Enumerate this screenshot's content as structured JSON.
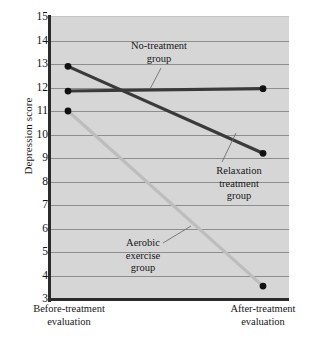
{
  "chart_data": {
    "type": "line",
    "title": "",
    "xlabel": "",
    "ylabel": "Depression score",
    "categories": [
      "Before-treatment evaluation",
      "After-treatment evaluation"
    ],
    "x": [
      0,
      1
    ],
    "ylim": [
      3,
      15
    ],
    "yticks": [
      15,
      14,
      13,
      12,
      11,
      10,
      9,
      8,
      7,
      6,
      5,
      4,
      3
    ],
    "grid": true,
    "legend_position": "inline-annotations",
    "series": [
      {
        "name": "No-treatment group",
        "values": [
          11.85,
          11.95
        ],
        "color": "#3a3a3a",
        "marker": "filled-circle"
      },
      {
        "name": "Relaxation treatment group",
        "values": [
          12.9,
          9.2
        ],
        "color": "#3a3a3a",
        "marker": "filled-circle"
      },
      {
        "name": "Aerobic exercise group",
        "values": [
          11.0,
          3.55
        ],
        "color": "#bdbdbd",
        "marker": "filled-circle"
      }
    ],
    "annotations": [
      {
        "text": "No-treatment\ngroup",
        "series": "No-treatment group"
      },
      {
        "text": "Relaxation\ntreatment\ngroup",
        "series": "Relaxation treatment group"
      },
      {
        "text": "Aerobic\nexercise\ngroup",
        "series": "Aerobic exercise group"
      }
    ],
    "xtick_labels": [
      "Before-treatment\nevaluation",
      "After-treatment\nevaluation"
    ]
  },
  "axes": {
    "y_title": "Depression score",
    "y_tick_labels": [
      "15",
      "14",
      "13",
      "12",
      "11",
      "10",
      "9",
      "8",
      "7",
      "6",
      "5",
      "4",
      "3"
    ],
    "x_tick_labels": [
      "Before-treatment\nevaluation",
      "After-treatment\nevaluation"
    ]
  },
  "annotations": {
    "no_treatment": "No-treatment\ngroup",
    "relaxation": "Relaxation\ntreatment\ngroup",
    "aerobic": "Aerobic\nexercise\ngroup"
  },
  "colors": {
    "plot_background": "#d6d6d6",
    "gridline": "#8e8e8e",
    "axis": "#2b2b2b",
    "dark_series": "#3a3a3a",
    "light_series": "#bdbdbd",
    "marker": "#111111",
    "text": "#171717"
  }
}
